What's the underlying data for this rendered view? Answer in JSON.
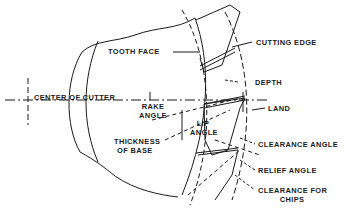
{
  "diagram": {
    "type": "engineering-drawing",
    "colors": {
      "line": "#1a1a1a",
      "background": "#ffffff"
    },
    "labels": {
      "tooth_face": "TOOTH FACE",
      "center_of_cutter": "CENTER OF CUTTER",
      "rake_angle_line1": "RAKE",
      "rake_angle_line2": "ANGLE",
      "thickness_line1": "THICKNESS",
      "thickness_line2": "OF BASE",
      "lip_angle_line1": "LIP",
      "lip_angle_line2": "ANGLE",
      "cutting_edge": "CUTTING EDGE",
      "depth": "DEPTH",
      "land": "LAND",
      "clearance_angle": "CLEARANCE ANGLE",
      "relief_angle": "RELIEF ANGLE",
      "clearance_for_chips_line1": "CLEARANCE FOR",
      "clearance_for_chips_line2": "CHIPS"
    }
  }
}
